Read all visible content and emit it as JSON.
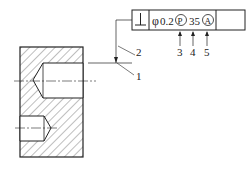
{
  "frame": {
    "symbol": "⊥",
    "diameter": "φ",
    "tolerance": "0.2",
    "modifier": "P",
    "projected_height": "35",
    "datum": "A"
  },
  "callouts": {
    "c1": "1",
    "c2": "2",
    "c3": "3",
    "c4": "4",
    "c5": "5"
  },
  "colors": {
    "line": "#222222",
    "hatch": "#444444"
  }
}
